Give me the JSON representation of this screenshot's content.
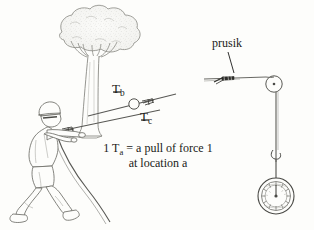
{
  "figure": {
    "background_color": "#fdfdfb",
    "ink_color": "#3a3a38"
  },
  "labels": {
    "tb_dash": "—",
    "tb_main": "T",
    "tb_sub": "b",
    "tc_dash": "—",
    "tc_main": "T",
    "tc_sub": "c",
    "prusik": "prusik"
  },
  "caption": {
    "prefix": "1 T",
    "sub": "a",
    "rest": " = a pull of force 1",
    "line2": "at location a"
  },
  "scene_left": {
    "tree": "oak-tree-with-canopy",
    "person": "person-pulling-rope",
    "rope": "rope-from-hands-to-anchor",
    "pulley": "small-pulley-circle",
    "anchor_point_b": "T_b attachment on tree rope",
    "anchor_point_c": "T_c rope segment"
  },
  "scene_right": {
    "horizontal_rope": "anchor-line",
    "knot": "prusik-knot",
    "pulley": "pulley-wheel",
    "vertical_rope": "hanging-rope",
    "hook": "connector-hook",
    "gauge": "circular-dial-scale"
  }
}
